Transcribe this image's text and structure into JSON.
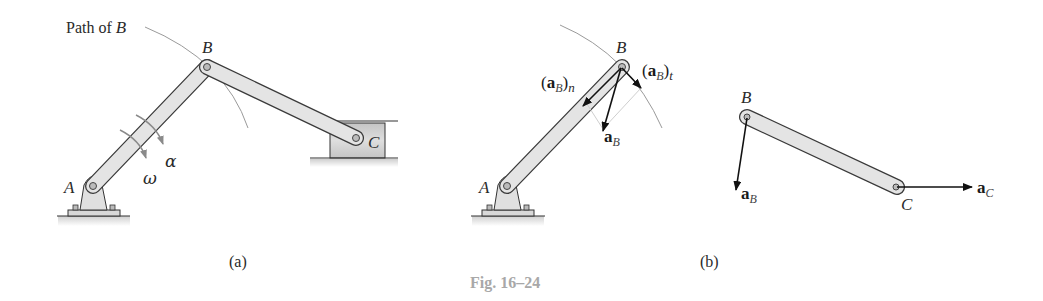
{
  "figure": {
    "caption": "Fig. 16–24",
    "colors": {
      "link_fill": "#e4e4e4",
      "link_stroke": "#3a3a3a",
      "path_arc": "#9a9a9a",
      "caption": "#a8a8a8",
      "slider_fill": "#d6d6d6"
    }
  },
  "panel_a": {
    "label": "(a)",
    "path_label": "Path of",
    "path_label_point": "B",
    "points": {
      "A": "A",
      "B": "B",
      "C": "C"
    },
    "omega": "ω",
    "alpha": "α"
  },
  "panel_b": {
    "label": "(b)",
    "points": {
      "A": "A",
      "B": "B",
      "B2": "B",
      "C": "C"
    },
    "vectors": {
      "aB_n": {
        "open": "(",
        "bold": "a",
        "sub": "B",
        "close": ")",
        "sub2": "n"
      },
      "aB_t": {
        "open": "(",
        "bold": "a",
        "sub": "B",
        "close": ")",
        "sub2": "t"
      },
      "aB": {
        "bold": "a",
        "sub": "B"
      },
      "aB2": {
        "bold": "a",
        "sub": "B"
      },
      "aC": {
        "bold": "a",
        "sub": "C"
      }
    }
  }
}
